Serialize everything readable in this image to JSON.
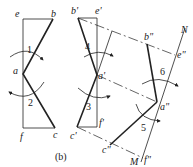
{
  "caption": "(b)",
  "left_figure": {
    "labels": {
      "e": "e",
      "b": "b",
      "a": "a",
      "f": "f",
      "c": "c"
    },
    "rotation_numbers": {
      "r1": "1",
      "r2": "2"
    }
  },
  "middle_figure": {
    "labels": {
      "b": "b'",
      "e": "e'",
      "a": "a'",
      "c": "c'",
      "f": "f'"
    },
    "rotation_numbers": {
      "r4": "4",
      "r3": "3"
    }
  },
  "right_figure": {
    "labels": {
      "b": "b\"",
      "e": "e\"",
      "a": "a\"",
      "c": "c\"",
      "f": "f\"",
      "N": "N",
      "M": "M"
    },
    "rotation_numbers": {
      "r6": "6",
      "r5": "5"
    }
  },
  "colors": {
    "line": "#222222",
    "background": "#ffffff"
  }
}
